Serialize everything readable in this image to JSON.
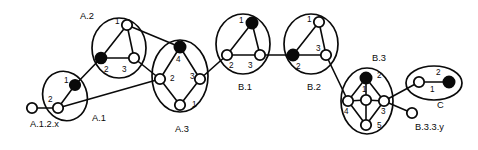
{
  "figure": {
    "background": "#ffffff",
    "ink": "#0a0a0a",
    "width": 478,
    "height": 150
  },
  "clusters": [
    {
      "id": "A1",
      "label": "A.1",
      "label_pos": {
        "x": 92,
        "y": 119
      },
      "shape": "ellipse",
      "cx": 65,
      "cy": 96,
      "rx": 22,
      "ry": 25,
      "rot": -20,
      "nodes": [
        {
          "name": "1",
          "x": 75,
          "y": 85,
          "fill": "filled",
          "r": 5.2,
          "num_pos": {
            "x": 64,
            "y": 81
          }
        },
        {
          "name": "2",
          "x": 58,
          "y": 108,
          "fill": "open",
          "r": 5.2,
          "num_pos": {
            "x": 48,
            "y": 100
          }
        }
      ],
      "edges": [
        [
          "1",
          "2"
        ]
      ]
    },
    {
      "id": "A2",
      "label": "A.2",
      "label_pos": {
        "x": 80,
        "y": 17
      },
      "shape": "ellipse",
      "cx": 119,
      "cy": 48,
      "rx": 27,
      "ry": 30,
      "rot": 0,
      "nodes": [
        {
          "name": "1",
          "x": 127,
          "y": 25,
          "fill": "open",
          "r": 5.2,
          "num_pos": {
            "x": 115,
            "y": 22
          }
        },
        {
          "name": "2",
          "x": 101,
          "y": 58,
          "fill": "filled",
          "r": 5.4,
          "num_pos": {
            "x": 104,
            "y": 70
          }
        },
        {
          "name": "3",
          "x": 134,
          "y": 58,
          "fill": "open",
          "r": 5.2,
          "num_pos": {
            "x": 122,
            "y": 70
          }
        }
      ],
      "edges": [
        [
          "1",
          "2"
        ],
        [
          "1",
          "3"
        ],
        [
          "2",
          "3"
        ]
      ]
    },
    {
      "id": "A3",
      "label": "A.3",
      "label_pos": {
        "x": 175,
        "y": 130
      },
      "shape": "ellipse",
      "cx": 180,
      "cy": 76,
      "rx": 28,
      "ry": 36,
      "rot": 0,
      "nodes": [
        {
          "name": "4",
          "x": 180,
          "y": 47,
          "fill": "filled",
          "r": 5.6,
          "num_pos": {
            "x": 176,
            "y": 60
          }
        },
        {
          "name": "2",
          "x": 160,
          "y": 79,
          "fill": "open",
          "r": 5.2,
          "num_pos": {
            "x": 170,
            "y": 79
          }
        },
        {
          "name": "3",
          "x": 200,
          "y": 79,
          "fill": "open",
          "r": 5.2,
          "num_pos": {
            "x": 190,
            "y": 77
          }
        },
        {
          "name": "1",
          "x": 180,
          "y": 105,
          "fill": "open",
          "r": 5.2,
          "num_pos": {
            "x": 192,
            "y": 105
          }
        }
      ],
      "edges": [
        [
          "4",
          "2"
        ],
        [
          "4",
          "3"
        ],
        [
          "2",
          "1"
        ],
        [
          "3",
          "1"
        ]
      ]
    },
    {
      "id": "B1",
      "label": "B.1",
      "label_pos": {
        "x": 238,
        "y": 88
      },
      "shape": "ellipse",
      "cx": 243,
      "cy": 44,
      "rx": 27,
      "ry": 30,
      "rot": 0,
      "nodes": [
        {
          "name": "1",
          "x": 252,
          "y": 23,
          "fill": "filled",
          "r": 5.6,
          "num_pos": {
            "x": 239,
            "y": 21
          }
        },
        {
          "name": "2",
          "x": 227,
          "y": 55,
          "fill": "open",
          "r": 5.2,
          "num_pos": {
            "x": 229,
            "y": 66
          }
        },
        {
          "name": "3",
          "x": 260,
          "y": 55,
          "fill": "open",
          "r": 5.2,
          "num_pos": {
            "x": 248,
            "y": 66
          }
        }
      ],
      "edges": [
        [
          "1",
          "2"
        ],
        [
          "1",
          "3"
        ],
        [
          "2",
          "3"
        ]
      ]
    },
    {
      "id": "B2",
      "label": "B.2",
      "label_pos": {
        "x": 307,
        "y": 88
      },
      "shape": "ellipse",
      "cx": 311,
      "cy": 44,
      "rx": 27,
      "ry": 30,
      "rot": 0,
      "nodes": [
        {
          "name": "1",
          "x": 319,
          "y": 22,
          "fill": "open",
          "r": 5.2,
          "num_pos": {
            "x": 307,
            "y": 20
          }
        },
        {
          "name": "2",
          "x": 293,
          "y": 55,
          "fill": "filled",
          "r": 5.6,
          "num_pos": {
            "x": 296,
            "y": 67
          }
        },
        {
          "name": "3",
          "x": 326,
          "y": 55,
          "fill": "open",
          "r": 5.2,
          "num_pos": {
            "x": 316,
            "y": 49
          }
        }
      ],
      "edges": [
        [
          "1",
          "2"
        ],
        [
          "1",
          "3"
        ],
        [
          "2",
          "3"
        ]
      ]
    },
    {
      "id": "B3",
      "label": "B.3",
      "label_pos": {
        "x": 372,
        "y": 59
      },
      "shape": "ellipse",
      "cx": 367,
      "cy": 101,
      "rx": 26,
      "ry": 33,
      "rot": 0,
      "nodes": [
        {
          "name": "2",
          "x": 366,
          "y": 78,
          "fill": "filled",
          "r": 5.6,
          "num_pos": {
            "x": 377,
            "y": 76
          }
        },
        {
          "name": "1",
          "x": 366,
          "y": 100,
          "fill": "open",
          "r": 5.2,
          "num_pos": {
            "x": 362,
            "y": 90
          }
        },
        {
          "name": "4",
          "x": 348,
          "y": 101,
          "fill": "open",
          "r": 5.2,
          "num_pos": {
            "x": 344,
            "y": 112
          }
        },
        {
          "name": "3",
          "x": 384,
          "y": 101,
          "fill": "open",
          "r": 5.2,
          "num_pos": {
            "x": 381,
            "y": 112
          }
        },
        {
          "name": "5",
          "x": 366,
          "y": 125,
          "fill": "open",
          "r": 5.2,
          "num_pos": {
            "x": 377,
            "y": 126
          }
        }
      ],
      "edges": [
        [
          "2",
          "4"
        ],
        [
          "2",
          "1"
        ],
        [
          "2",
          "3"
        ],
        [
          "4",
          "1"
        ],
        [
          "1",
          "3"
        ],
        [
          "4",
          "5"
        ],
        [
          "1",
          "5"
        ],
        [
          "5",
          "3"
        ]
      ]
    },
    {
      "id": "C",
      "label": "C",
      "label_pos": {
        "x": 437,
        "y": 106
      },
      "shape": "ellipse",
      "cx": 434,
      "cy": 83,
      "rx": 28,
      "ry": 17,
      "rot": 0,
      "nodes": [
        {
          "name": "1",
          "x": 419,
          "y": 82,
          "fill": "open",
          "r": 5.2,
          "num_pos": {
            "x": 430,
            "y": 90
          }
        },
        {
          "name": "2",
          "x": 449,
          "y": 82,
          "fill": "filled",
          "r": 5.6,
          "num_pos": {
            "x": 436,
            "y": 73
          }
        }
      ],
      "edges": [
        [
          "1",
          "2"
        ]
      ]
    }
  ],
  "free_nodes": [
    {
      "id": "A.1.2.x",
      "label": "A.1.2.x",
      "label_pos": {
        "x": 30,
        "y": 125
      },
      "x": 32,
      "y": 108,
      "r": 5.2,
      "fill": "open"
    },
    {
      "id": "B.3.3.y",
      "label": "B.3.y",
      "display_label": "B.3.3.y",
      "label_pos": {
        "x": 415,
        "y": 128
      },
      "x": 412,
      "y": 113,
      "r": 5.2,
      "fill": "open"
    }
  ],
  "inter_edges": [
    {
      "from": "A.1.2.x",
      "to": "A1.2",
      "x1": 32,
      "y1": 108,
      "x2": 58,
      "y2": 108
    },
    {
      "from": "A1.1",
      "to": "A2.2",
      "x1": 75,
      "y1": 85,
      "x2": 101,
      "y2": 58
    },
    {
      "from": "A1.2",
      "to": "A3.2",
      "x1": 58,
      "y1": 108,
      "x2": 160,
      "y2": 79
    },
    {
      "from": "A2.1",
      "to": "A3.4",
      "x1": 127,
      "y1": 25,
      "x2": 180,
      "y2": 47
    },
    {
      "from": "A2.3",
      "to": "A3.2",
      "x1": 134,
      "y1": 58,
      "x2": 160,
      "y2": 79
    },
    {
      "from": "A3.3",
      "to": "B1.2",
      "x1": 200,
      "y1": 79,
      "x2": 227,
      "y2": 55
    },
    {
      "from": "B1.3",
      "to": "B2.2",
      "x1": 260,
      "y1": 55,
      "x2": 293,
      "y2": 55
    },
    {
      "from": "B2.3",
      "to": "B3.4",
      "x1": 326,
      "y1": 55,
      "x2": 348,
      "y2": 101
    },
    {
      "from": "B3.3",
      "to": "C.1",
      "x1": 384,
      "y1": 101,
      "x2": 419,
      "y2": 82
    },
    {
      "from": "B3.3",
      "to": "B.3.3.y",
      "x1": 384,
      "y1": 101,
      "x2": 412,
      "y2": 113
    }
  ],
  "legend": {
    "filled_meaning": "filled node",
    "open_meaning": "open node"
  }
}
